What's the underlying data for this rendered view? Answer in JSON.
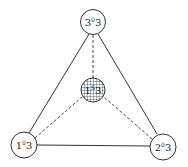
{
  "diagram": {
    "type": "tetrahedral-graph",
    "edge_color": "#333333",
    "nodes": [
      {
        "id": "top",
        "label_main": "3",
        "label_sup": "0",
        "label_sub": "3",
        "text": "3⁰3",
        "fill": "#ffffff",
        "pattern": "none"
      },
      {
        "id": "center",
        "label_main": "1",
        "label_sup": "S",
        "label_sub": "3",
        "text": "1ˢ3",
        "fill": "#ffffff",
        "pattern": "crosshatch"
      },
      {
        "id": "bottom-left",
        "label_main": "1",
        "label_sup": "0",
        "label_sub": "3",
        "text": "1⁰3",
        "fill": "#ffffff",
        "pattern": "none"
      },
      {
        "id": "bottom-right",
        "label_main": "2",
        "label_sup": "0",
        "label_sub": "3",
        "text": "2⁰3",
        "fill": "#ffffff",
        "pattern": "none"
      }
    ],
    "edges": [
      {
        "from": "top",
        "to": "bottom-left",
        "style": "solid"
      },
      {
        "from": "top",
        "to": "bottom-right",
        "style": "solid"
      },
      {
        "from": "bottom-left",
        "to": "bottom-right",
        "style": "solid"
      },
      {
        "from": "top",
        "to": "center",
        "style": "dashed"
      },
      {
        "from": "bottom-left",
        "to": "center",
        "style": "dashed"
      },
      {
        "from": "bottom-right",
        "to": "center",
        "style": "dashed"
      }
    ]
  }
}
